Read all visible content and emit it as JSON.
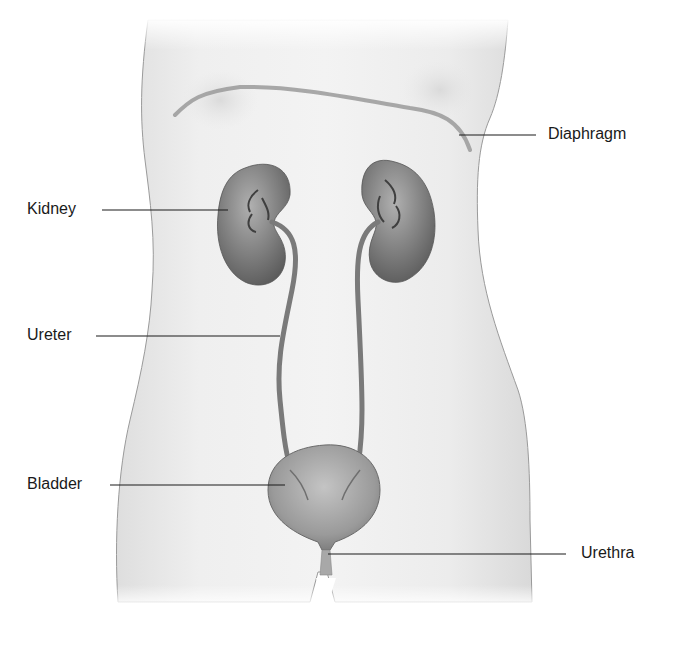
{
  "diagram": {
    "colors": {
      "skin": "#ebebeb",
      "skin_edge": "#9a9a9a",
      "organ": "#8a8a8a",
      "organ_dark": "#5e5e5e",
      "leader_line": "#1a1a1a",
      "label_text": "#1a1a1a"
    },
    "labels": [
      {
        "id": "diaphragm",
        "text": "Diaphragm",
        "side": "right"
      },
      {
        "id": "kidney",
        "text": "Kidney",
        "side": "left"
      },
      {
        "id": "ureter",
        "text": "Ureter",
        "side": "left"
      },
      {
        "id": "bladder",
        "text": "Bladder",
        "side": "left"
      },
      {
        "id": "urethra",
        "text": "Urethra",
        "side": "right"
      }
    ]
  }
}
